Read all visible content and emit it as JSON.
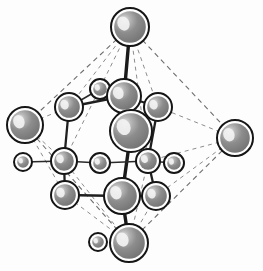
{
  "figure": {
    "background_color": "#fdfdfd",
    "width": 263,
    "height": 271
  },
  "palette": {
    "sphere_fill": "#8a8a8a",
    "sphere_shadow": "#6f6f6f",
    "sphere_highlight": "#e9e9e9",
    "sphere_outline": "#151515",
    "sphere_gap": "#ffffff",
    "bond_color": "#1a1a1a",
    "cell_edge_color": "#6e6e6e",
    "cell_edge_faint_color": "#8d8d8d"
  },
  "cell": {
    "style": "dashed",
    "shape": "octahedron",
    "vertices": [
      {
        "name": "apex-top",
        "x": 130,
        "y": 27
      },
      {
        "name": "apex-left",
        "x": 25,
        "y": 125
      },
      {
        "name": "apex-right",
        "x": 235,
        "y": 138
      },
      {
        "name": "apex-bottom",
        "x": 129,
        "y": 243
      }
    ],
    "edges": [
      {
        "from": "apex-top",
        "to": "apex-left"
      },
      {
        "from": "apex-top",
        "to": "apex-right"
      },
      {
        "from": "apex-left",
        "to": "apex-bottom"
      },
      {
        "from": "apex-right",
        "to": "apex-bottom"
      }
    ],
    "inner_edges": [
      {
        "from": "apex-top",
        "to": "corner-upper-left"
      },
      {
        "from": "apex-top",
        "to": "corner-upper-right"
      },
      {
        "from": "apex-left",
        "to": "corner-mid-left"
      },
      {
        "from": "apex-right",
        "to": "corner-mid-right"
      },
      {
        "from": "apex-bottom",
        "to": "corner-lower-left"
      },
      {
        "from": "apex-bottom",
        "to": "corner-lower-right"
      }
    ]
  },
  "atoms": [
    {
      "id": "a1",
      "label": "apex-top",
      "size": "large",
      "x": 130,
      "y": 27,
      "r": 19
    },
    {
      "id": "a2",
      "label": "apex-left",
      "size": "large",
      "x": 25,
      "y": 125,
      "r": 18
    },
    {
      "id": "a3",
      "label": "apex-right",
      "size": "large",
      "x": 235,
      "y": 138,
      "r": 18
    },
    {
      "id": "a4",
      "label": "apex-bottom",
      "size": "large",
      "x": 129,
      "y": 243,
      "r": 19
    },
    {
      "id": "a5",
      "label": "center-large",
      "size": "large",
      "x": 131,
      "y": 131,
      "r": 21
    },
    {
      "id": "a6",
      "label": "upper-center",
      "size": "medium",
      "x": 124,
      "y": 96,
      "r": 17
    },
    {
      "id": "a7",
      "label": "upper-left-ring",
      "size": "medium",
      "x": 69,
      "y": 107,
      "r": 14
    },
    {
      "id": "a8",
      "label": "upper-right-ring",
      "size": "medium",
      "x": 158,
      "y": 107,
      "r": 14
    },
    {
      "id": "a9",
      "label": "mid-left-ring",
      "size": "medium",
      "x": 64,
      "y": 161,
      "r": 13
    },
    {
      "id": "a10",
      "label": "mid-right-ring",
      "size": "medium",
      "x": 148,
      "y": 161,
      "r": 12
    },
    {
      "id": "a11",
      "label": "lower-left-ring",
      "size": "medium",
      "x": 65,
      "y": 195,
      "r": 14
    },
    {
      "id": "a12",
      "label": "lower-center",
      "size": "large",
      "x": 122,
      "y": 196,
      "r": 18
    },
    {
      "id": "a13",
      "label": "lower-right-ring",
      "size": "medium",
      "x": 156,
      "y": 196,
      "r": 14
    },
    {
      "id": "a14",
      "label": "small-upper",
      "size": "small",
      "x": 100,
      "y": 89,
      "r": 10
    },
    {
      "id": "a15",
      "label": "small-left",
      "size": "small",
      "x": 23,
      "y": 162,
      "r": 9
    },
    {
      "id": "a16",
      "label": "small-center",
      "size": "small",
      "x": 100,
      "y": 163,
      "r": 10
    },
    {
      "id": "a17",
      "label": "small-right",
      "size": "small",
      "x": 174,
      "y": 163,
      "r": 10
    },
    {
      "id": "a18",
      "label": "small-bottom",
      "size": "small",
      "x": 98,
      "y": 242,
      "r": 9
    }
  ],
  "bonds": [
    {
      "from": "a1",
      "to": "a6",
      "weight": "thick"
    },
    {
      "from": "a6",
      "to": "a5",
      "weight": "thick"
    },
    {
      "from": "a5",
      "to": "a12",
      "weight": "thick"
    },
    {
      "from": "a12",
      "to": "a4",
      "weight": "thick"
    },
    {
      "from": "a6",
      "to": "a7",
      "weight": "normal"
    },
    {
      "from": "a6",
      "to": "a8",
      "weight": "normal"
    },
    {
      "from": "a6",
      "to": "a14",
      "weight": "normal"
    },
    {
      "from": "a7",
      "to": "a9",
      "weight": "normal"
    },
    {
      "from": "a8",
      "to": "a10",
      "weight": "normal"
    },
    {
      "from": "a9",
      "to": "a11",
      "weight": "normal"
    },
    {
      "from": "a10",
      "to": "a13",
      "weight": "normal"
    },
    {
      "from": "a11",
      "to": "a12",
      "weight": "normal"
    },
    {
      "from": "a12",
      "to": "a13",
      "weight": "normal"
    },
    {
      "from": "a9",
      "to": "a16",
      "weight": "thin"
    },
    {
      "from": "a16",
      "to": "a10",
      "weight": "thin"
    },
    {
      "from": "a9",
      "to": "a15",
      "weight": "thin"
    },
    {
      "from": "a10",
      "to": "a17",
      "weight": "thin"
    },
    {
      "from": "a14",
      "to": "a7",
      "weight": "thin"
    }
  ]
}
